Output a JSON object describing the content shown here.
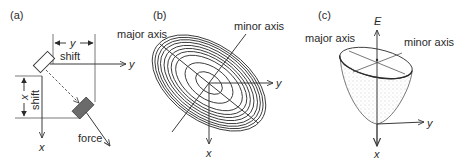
{
  "figure": {
    "panels": [
      {
        "id": "a",
        "label": "(a)",
        "axis_y_label": "y",
        "axis_x_label": "x",
        "y_shift": {
          "symbol": "y",
          "text": "shift"
        },
        "x_shift": {
          "symbol": "x",
          "text": "shift"
        },
        "force_label": "force",
        "elements": [
          "white-box-original",
          "gray-box-displaced",
          "dashed-displacement-line",
          "force-arrow"
        ]
      },
      {
        "id": "b",
        "label": "(b)",
        "major_axis_label": "major axis",
        "minor_axis_label": "minor axis",
        "axis_y_label": "y",
        "axis_x_label": "x",
        "contour_count": 10
      },
      {
        "id": "c",
        "label": "(c)",
        "axis_e_label": "E",
        "major_axis_label": "major axis",
        "minor_axis_label": "minor axis",
        "axis_y_label": "y",
        "axis_x_label": "x"
      }
    ],
    "colors": {
      "line": "#3a3a3a",
      "gray_box": "#6b6b6b",
      "stipple": "#9a9a9a",
      "background": "#ffffff"
    }
  }
}
